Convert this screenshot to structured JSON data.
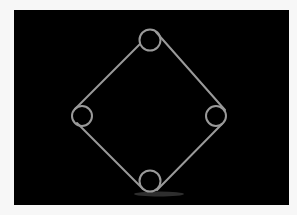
{
  "figure": {
    "background_color": "#000000",
    "page_color": "#f7f7f7",
    "stroke_color": "#9a9a9a",
    "shadow_color": "#3a3a3a",
    "loops": [
      {
        "name": "top",
        "cx": 150,
        "cy": 40,
        "r": 10.5
      },
      {
        "name": "left",
        "cx": 82,
        "cy": 116,
        "r": 10
      },
      {
        "name": "right",
        "cx": 216,
        "cy": 116,
        "r": 10
      },
      {
        "name": "bottom",
        "cx": 150,
        "cy": 181,
        "r": 10.5
      }
    ],
    "segments": [
      {
        "name": "top-left",
        "x1": 140,
        "y1": 44,
        "x2": 75,
        "y2": 109
      },
      {
        "name": "top-right",
        "x1": 156,
        "y1": 32,
        "x2": 225,
        "y2": 110
      },
      {
        "name": "bottom-left",
        "x1": 77,
        "y1": 123,
        "x2": 143,
        "y2": 189
      },
      {
        "name": "bottom-right",
        "x1": 222,
        "y1": 124,
        "x2": 157,
        "y2": 190
      }
    ],
    "shadow": {
      "cx": 159,
      "cy": 194,
      "rx": 25,
      "ry": 2.5
    }
  }
}
